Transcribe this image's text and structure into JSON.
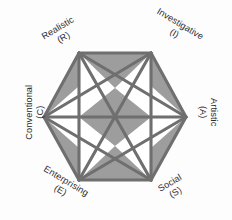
{
  "figure": {
    "type": "hexagon-network-diagram",
    "background_color": "#fdfdfd",
    "fill_color": "#9d9d9d",
    "line_color": "#6f6f6f",
    "white_region_color": "#ffffff",
    "text_color": "#2b2b2b",
    "line_width": 3.1,
    "center": {
      "x": 115,
      "y": 117
    },
    "radius": 71
  },
  "vertices": [
    {
      "id": "realistic",
      "name": "Realistic",
      "code": "(R)",
      "position": "top-left",
      "point": {
        "x": 79,
        "y": 53
      },
      "rotation_deg": -31
    },
    {
      "id": "investigative",
      "name": "Investigative",
      "code": "(I)",
      "position": "top-right",
      "point": {
        "x": 151,
        "y": 53
      },
      "rotation_deg": 31
    },
    {
      "id": "artistic",
      "name": "Artistic",
      "code": "(A)",
      "position": "right",
      "point": {
        "x": 186,
        "y": 117
      },
      "rotation_deg": 90
    },
    {
      "id": "social",
      "name": "Social",
      "code": "(S)",
      "position": "bottom-right",
      "point": {
        "x": 151,
        "y": 180
      },
      "rotation_deg": -31
    },
    {
      "id": "enterprising",
      "name": "Enterprising",
      "code": "(E)",
      "position": "bottom-left",
      "point": {
        "x": 79,
        "y": 180
      },
      "rotation_deg": 31
    },
    {
      "id": "conventional",
      "name": "Conventional",
      "code": "(C)",
      "position": "left",
      "point": {
        "x": 44,
        "y": 117
      },
      "rotation_deg": -90
    }
  ],
  "connections": [
    [
      "realistic",
      "investigative"
    ],
    [
      "realistic",
      "artistic"
    ],
    [
      "realistic",
      "social"
    ],
    [
      "realistic",
      "enterprising"
    ],
    [
      "realistic",
      "conventional"
    ],
    [
      "investigative",
      "artistic"
    ],
    [
      "investigative",
      "social"
    ],
    [
      "investigative",
      "enterprising"
    ],
    [
      "investigative",
      "conventional"
    ],
    [
      "artistic",
      "social"
    ],
    [
      "artistic",
      "enterprising"
    ],
    [
      "artistic",
      "conventional"
    ],
    [
      "social",
      "enterprising"
    ],
    [
      "social",
      "conventional"
    ],
    [
      "enterprising",
      "conventional"
    ]
  ]
}
